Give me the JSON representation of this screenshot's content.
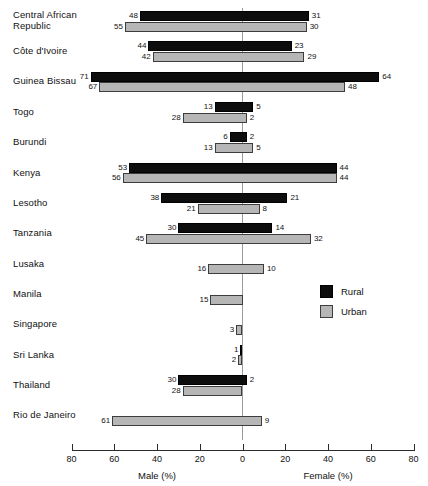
{
  "chart_data": {
    "type": "bar",
    "orientation": "horizontal-diverging",
    "title": "",
    "xlabel_left": "Male (%)",
    "xlabel_right": "Female (%)",
    "ylabel": "",
    "xlim": [
      -80,
      80
    ],
    "xticks": [
      80,
      60,
      40,
      20,
      0,
      20,
      40,
      60,
      80
    ],
    "grid": false,
    "legend_position": "middle-right",
    "series": [
      {
        "name": "Rural",
        "color": "#0d0d0d"
      },
      {
        "name": "Urban",
        "color": "#b6b6b6"
      }
    ],
    "categories": [
      "Central African\nRepublic",
      "Côte d'Ivoire",
      "Guinea Bissau",
      "Togo",
      "Burundi",
      "Kenya",
      "Lesotho",
      "Tanzania",
      "Lusaka",
      "Manila",
      "Singapore",
      "Sri Lanka",
      "Thailand",
      "Rio de Janeiro"
    ],
    "rows": [
      {
        "category": "Central African\nRepublic",
        "rural_male": 48,
        "rural_female": 31,
        "urban_male": 55,
        "urban_female": 30
      },
      {
        "category": "Côte d'Ivoire",
        "rural_male": 44,
        "rural_female": 23,
        "urban_male": 42,
        "urban_female": 29
      },
      {
        "category": "Guinea Bissau",
        "rural_male": 71,
        "rural_female": 64,
        "urban_male": 67,
        "urban_female": 48
      },
      {
        "category": "Togo",
        "rural_male": 13,
        "rural_female": 5,
        "urban_male": 28,
        "urban_female": 2
      },
      {
        "category": "Burundi",
        "rural_male": 6,
        "rural_female": 2,
        "urban_male": 13,
        "urban_female": 5
      },
      {
        "category": "Kenya",
        "rural_male": 53,
        "rural_female": 44,
        "urban_male": 56,
        "urban_female": 44
      },
      {
        "category": "Lesotho",
        "rural_male": 38,
        "rural_female": 21,
        "urban_male": 21,
        "urban_female": 8
      },
      {
        "category": "Tanzania",
        "rural_male": 30,
        "rural_female": 14,
        "urban_male": 45,
        "urban_female": 32
      },
      {
        "category": "Lusaka",
        "rural_male": null,
        "rural_female": null,
        "urban_male": 16,
        "urban_female": 10
      },
      {
        "category": "Manila",
        "rural_male": null,
        "rural_female": null,
        "urban_male": 15,
        "urban_female": null
      },
      {
        "category": "Singapore",
        "rural_male": null,
        "rural_female": null,
        "urban_male": 3,
        "urban_female": null
      },
      {
        "category": "Sri Lanka",
        "rural_male": 1,
        "rural_female": null,
        "urban_male": 2,
        "urban_female": null
      },
      {
        "category": "Thailand",
        "rural_male": 30,
        "rural_female": 2,
        "urban_male": 28,
        "urban_female": null
      },
      {
        "category": "Rio de Janeiro",
        "rural_male": null,
        "rural_female": null,
        "urban_male": 61,
        "urban_female": 9
      }
    ]
  },
  "legend": {
    "items": [
      {
        "label": "Rural",
        "key": "rural"
      },
      {
        "label": "Urban",
        "key": "urban"
      }
    ]
  },
  "axis": {
    "left_title": "Male (%)",
    "right_title": "Female (%)",
    "tick_labels": [
      "80",
      "60",
      "40",
      "20",
      "0",
      "20",
      "40",
      "60",
      "80"
    ]
  }
}
